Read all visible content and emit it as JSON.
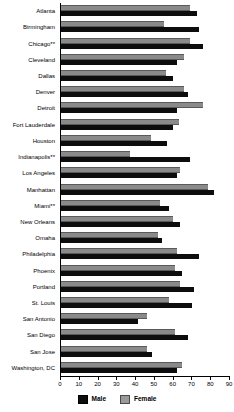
{
  "chart_data": {
    "type": "bar",
    "orientation": "horizontal",
    "title": "",
    "xlabel": "",
    "ylabel": "",
    "xlim": [
      0,
      90
    ],
    "xticks": [
      0,
      10,
      20,
      30,
      40,
      50,
      60,
      70,
      80,
      90
    ],
    "grid": false,
    "legend_position": "bottom",
    "categories": [
      "Atlanta",
      "Birmingham",
      "Chicago**",
      "Cleveland",
      "Dallas",
      "Denver",
      "Detroit",
      "Fort Lauderdale",
      "Houston",
      "Indianapolis**",
      "Los Angeles",
      "Manhattan",
      "Miami**",
      "New Orleans",
      "Omaha",
      "Philadelphia",
      "Phoenix",
      "Portland",
      "St. Louis",
      "San Antonio",
      "San Diego",
      "San Jose",
      "Washington, DC"
    ],
    "series": [
      {
        "name": "Male",
        "color": "#0d0d0d",
        "values": [
          73,
          74,
          76,
          62,
          60,
          68,
          62,
          60,
          57,
          69,
          62,
          82,
          58,
          64,
          54,
          74,
          65,
          71,
          70,
          41,
          68,
          49,
          62
        ]
      },
      {
        "name": "Female",
        "color": "#8a8a8a",
        "values": [
          69,
          55,
          69,
          66,
          56,
          66,
          76,
          63,
          48,
          37,
          64,
          79,
          53,
          60,
          52,
          62,
          61,
          64,
          58,
          46,
          61,
          46,
          65
        ]
      }
    ]
  },
  "legend": {
    "items": [
      {
        "label": "Male"
      },
      {
        "label": "Female"
      }
    ]
  }
}
